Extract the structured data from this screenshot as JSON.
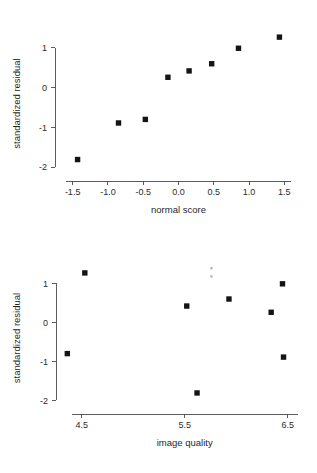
{
  "figure": {
    "background_color": "#ffffff",
    "point_color": "#141414",
    "axis_color": "#4a4a4a",
    "text_color": "#2b2b2b"
  },
  "chart_data": [
    {
      "id": "normal-probability-plot",
      "type": "scatter",
      "title": "",
      "xlabel": "normal score",
      "ylabel": "standardized residual",
      "xlim": [
        -1.75,
        1.75
      ],
      "ylim": [
        -2.35,
        1.55
      ],
      "grid": false,
      "legend": "none",
      "xticks": [
        -1.5,
        -1.0,
        -0.5,
        0.0,
        0.5,
        1.0,
        1.5
      ],
      "xticklabels": [
        "-1.5",
        "-1.0",
        "-0.5",
        "0.0",
        "0.5",
        "1.0",
        "1.5"
      ],
      "yticks": [
        1,
        0,
        -1,
        -2
      ],
      "yticklabels": [
        "1",
        "0",
        "-1",
        "-2"
      ],
      "x": [
        -1.43,
        -0.85,
        -0.47,
        -0.15,
        0.15,
        0.47,
        0.85,
        1.43
      ],
      "y": [
        -1.81,
        -0.89,
        -0.8,
        0.26,
        0.42,
        0.6,
        0.99,
        1.27
      ]
    },
    {
      "id": "residual-vs-image-quality-plot",
      "type": "scatter",
      "title": "",
      "xlabel": "image quality",
      "ylabel": "standardized residual",
      "xlim": [
        4.25,
        6.62
      ],
      "ylim": [
        -2.35,
        1.55
      ],
      "grid": false,
      "legend": "none",
      "xticks": [
        4.5,
        5.5,
        6.5
      ],
      "xticklabels": [
        "4.5",
        "5.5",
        "6.5"
      ],
      "yticks": [
        1,
        0,
        -1,
        -2
      ],
      "yticklabels": [
        "1",
        "0",
        "-1",
        "-2"
      ],
      "x": [
        4.36,
        4.53,
        5.52,
        5.62,
        5.93,
        6.34,
        6.45,
        6.46
      ],
      "y": [
        -0.8,
        1.27,
        0.42,
        -1.81,
        0.6,
        0.26,
        0.99,
        -0.89
      ],
      "annotations": [
        {
          "name": "faint-smudge",
          "x": 5.76,
          "y": 1.39
        },
        {
          "name": "faint-smudge",
          "x": 5.76,
          "y": 1.18
        }
      ]
    }
  ]
}
